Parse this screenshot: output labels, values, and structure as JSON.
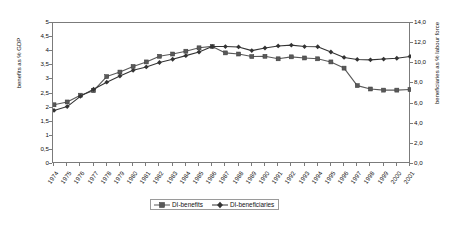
{
  "chart_data": {
    "type": "line",
    "title": "",
    "xlabel": "",
    "ylabel": "benefits as % GDP",
    "ylabel_right": "beneficiaries as % labour force",
    "grid": false,
    "legend_position": "bottom-center",
    "ylim": [
      0,
      5
    ],
    "yticks": [
      "0",
      "0,5",
      "1",
      "1,5",
      "2",
      "2,5",
      "3",
      "3,5",
      "4",
      "4,5",
      "5"
    ],
    "ylim_right": [
      0,
      14
    ],
    "yticks_right": [
      "0,0",
      "2,0",
      "4,0",
      "6,0",
      "8,0",
      "10,0",
      "12,0",
      "14,0"
    ],
    "categories": [
      "1974",
      "1975",
      "1976",
      "1977",
      "1978",
      "1979",
      "1980",
      "1981",
      "1982",
      "1983",
      "1984",
      "1985",
      "1986",
      "1987",
      "1988",
      "1989",
      "1990",
      "1991",
      "1992",
      "1993",
      "1994",
      "1995",
      "1996",
      "1997",
      "1998",
      "1999",
      "2000",
      "2001"
    ],
    "series": [
      {
        "name": "DI-benefits",
        "axis": "left",
        "marker": "square",
        "color": "#595959",
        "values": [
          2.1,
          2.2,
          2.44,
          2.6,
          3.1,
          3.26,
          3.46,
          3.62,
          3.82,
          3.9,
          4.0,
          4.12,
          4.17,
          3.94,
          3.9,
          3.81,
          3.82,
          3.73,
          3.8,
          3.76,
          3.73,
          3.62,
          3.4,
          2.78,
          2.66,
          2.62,
          2.62,
          2.64
        ]
      },
      {
        "name": "DI-beneficiaries",
        "axis": "right",
        "marker": "diamond",
        "color": "#333333",
        "values": [
          5.32,
          5.7,
          6.72,
          7.42,
          8.12,
          8.74,
          9.3,
          9.64,
          10.08,
          10.4,
          10.76,
          11.12,
          11.66,
          11.66,
          11.62,
          11.26,
          11.52,
          11.72,
          11.8,
          11.66,
          11.64,
          11.12,
          10.58,
          10.38,
          10.34,
          10.42,
          10.5,
          10.68
        ]
      }
    ]
  },
  "legend": {
    "items": [
      {
        "label": "DI-benefits"
      },
      {
        "label": "DI-beneficiaries"
      }
    ]
  }
}
